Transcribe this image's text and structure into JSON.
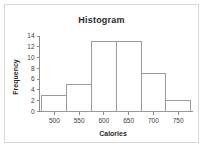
{
  "chart_data": {
    "type": "bar",
    "title": "Histogram",
    "xlabel": "Calories",
    "ylabel": "Frequency",
    "bin_edges": [
      475,
      525,
      575,
      625,
      675,
      725,
      775
    ],
    "categories": [
      "475-525",
      "525-575",
      "575-625",
      "625-675",
      "675-725",
      "725-775"
    ],
    "values": [
      3,
      5,
      13,
      13,
      7,
      2
    ],
    "xticks": [
      500,
      550,
      600,
      650,
      700,
      750
    ],
    "yticks": [
      0,
      2,
      4,
      6,
      8,
      10,
      12,
      14
    ],
    "xlim": [
      470,
      780
    ],
    "ylim": [
      0,
      14
    ],
    "grid": false,
    "legend": false,
    "bar_fill_color": "#ffffff",
    "bar_edge_color": "#9a9a9a",
    "axis_color": "#8c8c8c",
    "frame_color": "#d8d8d8",
    "text_color": "#2b2b2b"
  }
}
